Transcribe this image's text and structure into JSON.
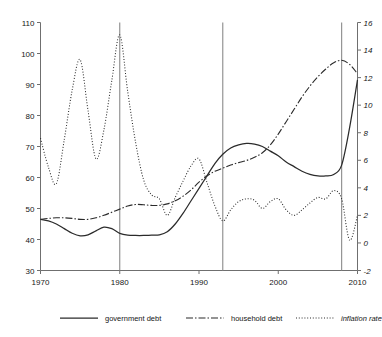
{
  "chart_data": {
    "type": "line",
    "title": "",
    "subtitle": "",
    "xlabel": "",
    "ylabel": "",
    "y2label": "",
    "xlim": [
      1970,
      2010
    ],
    "ylim": [
      30,
      110
    ],
    "y2lim": [
      -2,
      16
    ],
    "grid": false,
    "legend_position": "bottom",
    "x_ticks": [
      "1970",
      "1980",
      "1990",
      "2000",
      "2010"
    ],
    "x_tick_values": [
      1970,
      1980,
      1990,
      2000,
      2010
    ],
    "y_ticks": [
      "30",
      "40",
      "50",
      "60",
      "70",
      "80",
      "90",
      "100",
      "110"
    ],
    "y_tick_values": [
      30,
      40,
      50,
      60,
      70,
      80,
      90,
      100,
      110
    ],
    "y2_ticks": [
      "-2",
      "0",
      "2",
      "4",
      "6",
      "8",
      "10",
      "12",
      "14",
      "16"
    ],
    "y2_tick_values": [
      -2,
      0,
      2,
      4,
      6,
      8,
      10,
      12,
      14,
      16
    ],
    "annotations": [
      {
        "type": "vline",
        "x": 1980,
        "label": ""
      },
      {
        "type": "vline",
        "x": 1993,
        "label": ""
      },
      {
        "type": "vline",
        "x": 2008,
        "label": ""
      }
    ],
    "x": [
      1970,
      1971,
      1972,
      1973,
      1974,
      1975,
      1976,
      1977,
      1978,
      1979,
      1980,
      1981,
      1982,
      1983,
      1984,
      1985,
      1986,
      1987,
      1988,
      1989,
      1990,
      1991,
      1992,
      1993,
      1994,
      1995,
      1996,
      1997,
      1998,
      1999,
      2000,
      2001,
      2002,
      2003,
      2004,
      2005,
      2006,
      2007,
      2008,
      2009,
      2010
    ],
    "series": [
      {
        "name": "government debt",
        "axis": "left",
        "style": "solid",
        "values": [
          46.5,
          46.0,
          45.0,
          43.5,
          42.0,
          41.2,
          41.5,
          42.8,
          44.0,
          43.5,
          42.0,
          41.4,
          41.3,
          41.3,
          41.4,
          41.5,
          42.5,
          45.0,
          48.5,
          52.5,
          56.5,
          60.5,
          64.5,
          67.5,
          69.5,
          70.5,
          71.0,
          70.8,
          70.0,
          68.5,
          67.0,
          65.0,
          63.5,
          62.0,
          61.0,
          60.5,
          60.5,
          61.0,
          64.0,
          76.0,
          91.5
        ]
      },
      {
        "name": "household debt",
        "axis": "left",
        "style": "dashdot",
        "values": [
          46.5,
          46.8,
          47.0,
          47.0,
          46.8,
          46.5,
          46.5,
          47.0,
          47.8,
          48.8,
          49.8,
          50.8,
          51.3,
          51.2,
          51.0,
          51.0,
          51.5,
          52.5,
          54.0,
          56.0,
          58.5,
          60.5,
          62.0,
          63.0,
          64.0,
          64.8,
          65.5,
          66.5,
          68.0,
          70.5,
          74.0,
          78.0,
          82.0,
          86.0,
          89.5,
          92.5,
          95.0,
          97.0,
          97.8,
          96.5,
          93.5
        ]
      },
      {
        "name": "inflation rate",
        "axis": "right",
        "style": "dotted",
        "values": [
          7.6,
          5.5,
          4.3,
          7.5,
          11.1,
          13.3,
          9.6,
          6.1,
          8.2,
          11.8,
          15.1,
          11.0,
          7.3,
          4.6,
          3.5,
          3.2,
          2.0,
          3.3,
          4.5,
          5.6,
          6.1,
          4.4,
          2.7,
          1.6,
          2.4,
          3.0,
          3.2,
          3.1,
          2.5,
          3.0,
          3.2,
          2.4,
          2.0,
          2.4,
          2.9,
          3.3,
          3.2,
          3.8,
          3.2,
          0.2,
          2.0
        ]
      }
    ]
  },
  "legend": {
    "items": [
      {
        "label": "government debt",
        "style": "solid"
      },
      {
        "label": "household debt",
        "style": "dashdot"
      },
      {
        "label": "inflation rate",
        "style": "dotted",
        "italic": true
      }
    ]
  }
}
